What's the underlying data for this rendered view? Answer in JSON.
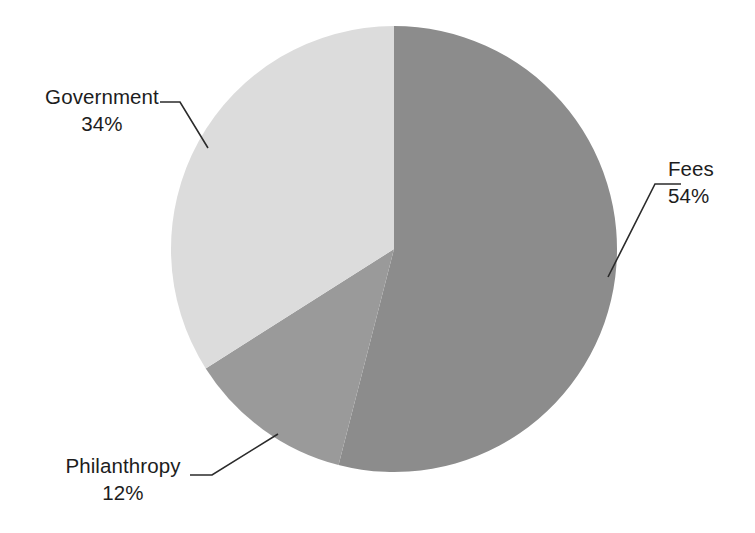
{
  "chart_data": {
    "type": "pie",
    "title": "",
    "subtitle": "",
    "xlabel": "",
    "ylabel": "",
    "legend_position": "none",
    "grid": false,
    "labels_outside": true,
    "start_angle_deg": 0,
    "direction": "clockwise",
    "categories": [
      "Fees",
      "Philanthropy",
      "Government"
    ],
    "values": [
      54,
      12,
      34
    ],
    "value_unit": "%",
    "colors": [
      "#8c8c8c",
      "#9a9a9a",
      "#dcdcdc"
    ],
    "slices": [
      {
        "name": "Fees",
        "value": 54,
        "label": "Fees",
        "pct_label": "54%",
        "color": "#8c8c8c",
        "start_deg": 0,
        "end_deg": 194.4
      },
      {
        "name": "Philanthropy",
        "value": 12,
        "label": "Philanthropy",
        "pct_label": "12%",
        "color": "#9a9a9a",
        "start_deg": 194.4,
        "end_deg": 237.6
      },
      {
        "name": "Government",
        "value": 34,
        "label": "Government",
        "pct_label": "34%",
        "color": "#dcdcdc",
        "start_deg": 237.6,
        "end_deg": 360
      }
    ]
  },
  "labels": {
    "government": {
      "name": "Government",
      "pct": "34%"
    },
    "fees": {
      "name": "Fees",
      "pct": "54%"
    },
    "philanthropy": {
      "name": "Philanthropy",
      "pct": "12%"
    }
  },
  "colors": {
    "background": "#ffffff",
    "text": "#1d1d1d",
    "leader_line": "#2b2b2b",
    "slice_fees": "#8c8c8c",
    "slice_philanthropy": "#9a9a9a",
    "slice_government": "#dcdcdc"
  }
}
